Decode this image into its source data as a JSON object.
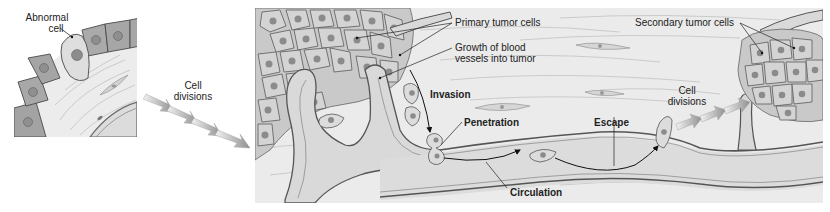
{
  "figure": {
    "colors": {
      "tissue": "#e9e9e9",
      "tissue_fiber": "#c4c4c4",
      "cell_fill": "#cfcfcf",
      "cell_dark": "#9a9a9a",
      "nucleus": "#8a8a8a",
      "vessel": "#d9d9d9",
      "vessel_wall": "#8e8e8e",
      "outline": "#555555",
      "arrow_fill": "#9d9d9d",
      "text": "#222222"
    }
  },
  "panels": {
    "origin": {
      "labels": {
        "abnormal_cell": [
          "Abnormal",
          "cell"
        ]
      }
    },
    "transition": {
      "labels": {
        "cell_divisions": [
          "Cell",
          "divisions"
        ]
      }
    },
    "metastasis": {
      "labels": {
        "primary_tumor_cells": "Primary tumor cells",
        "growth_of_vessels": [
          "Growth of blood",
          "vessels into tumor"
        ],
        "invasion": "Invasion",
        "penetration": "Penetration",
        "circulation": "Circulation",
        "escape": "Escape",
        "cell_divisions": [
          "Cell",
          "divisions"
        ],
        "secondary_tumor_cells": "Secondary tumor cells"
      }
    }
  }
}
